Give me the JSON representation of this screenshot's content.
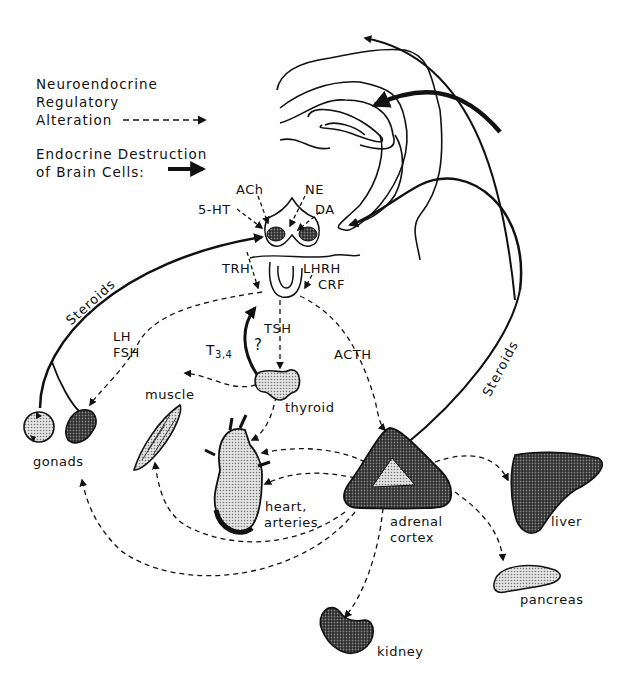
{
  "legend": {
    "items": [
      {
        "label": "Neuroendocrine Regulatory Alteration",
        "line1": "Neuroendocrine",
        "line2": "Regulatory",
        "line3": "Alteration",
        "style": "dashed-arrow"
      },
      {
        "label": "Endocrine Destruction of Brain Cells:",
        "line1": "Endocrine Destruction",
        "line2": "of Brain Cells:",
        "style": "solid-thick-arrow"
      }
    ]
  },
  "neurotransmitters": {
    "ach": "ACh",
    "ne": "NE",
    "serotonin": "5-HT",
    "da": "DA"
  },
  "releasing_hormones": {
    "trh": "TRH",
    "lhrh": "LHRH",
    "crf": "CRF"
  },
  "pituitary_hormones": {
    "lh": "LH",
    "fsh": "FSH",
    "tsh": "TSH",
    "acth": "ACTH"
  },
  "feedback": {
    "t34_base": "T",
    "t34_sub": "3,4",
    "question": "?",
    "steroids_left": "Steroids",
    "steroids_right": "Steroids"
  },
  "organs": {
    "gonads": "gonads",
    "muscle": "muscle",
    "thyroid": "thyroid",
    "heart_line1": "heart,",
    "heart_line2": "arteries",
    "adrenal_line1": "adrenal",
    "adrenal_line2": "cortex",
    "liver": "liver",
    "pancreas": "pancreas",
    "kidney": "kidney"
  },
  "colors": {
    "ink": "#111111",
    "stipple_light": "#cfcfcf",
    "stipple_dark": "#3a3a3a",
    "background": "#ffffff"
  }
}
